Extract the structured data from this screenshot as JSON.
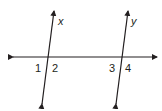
{
  "diagram": {
    "stroke_color": "#231f20",
    "lines": [
      {
        "name": "transversal",
        "label": ""
      },
      {
        "name": "line-x",
        "label": "x"
      },
      {
        "name": "line-y",
        "label": "y"
      }
    ],
    "angles": [
      {
        "id": "angle-1",
        "label": "1"
      },
      {
        "id": "angle-2",
        "label": "2"
      },
      {
        "id": "angle-3",
        "label": "3"
      },
      {
        "id": "angle-4",
        "label": "4"
      }
    ]
  }
}
